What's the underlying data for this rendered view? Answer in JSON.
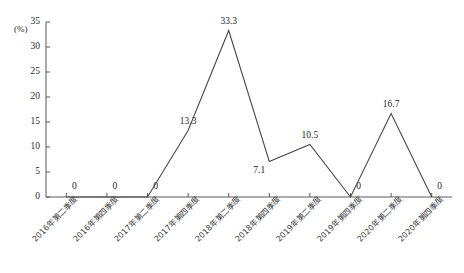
{
  "chart_data": {
    "type": "line",
    "title": "",
    "xlabel": "",
    "ylabel": "(%)",
    "ylim": [
      0,
      35
    ],
    "ytick_values": [
      0,
      5,
      10,
      15,
      20,
      25,
      30,
      35
    ],
    "ytick_labels": [
      "0",
      "5",
      "10",
      "15",
      "20",
      "25",
      "30",
      "35"
    ],
    "grid": false,
    "legend": "none",
    "line_color": "#4a4a4a",
    "categories": [
      "2016年第二季度",
      "2016年第四季度",
      "2017年第二季度",
      "2017年第四季度",
      "2018年第二季度",
      "2018年第四季度",
      "2019年第二季度",
      "2019年第四季度",
      "2020年第二季度",
      "2020年第四季度"
    ],
    "values": [
      0,
      0,
      0,
      13.3,
      33.3,
      7.1,
      10.5,
      0,
      16.7,
      0
    ],
    "point_labels": [
      "0",
      "0",
      "0",
      "13.3",
      "33.3",
      "7.1",
      "10.5",
      "0",
      "16.7",
      "0"
    ],
    "label_positions": [
      "above",
      "above",
      "above",
      "above",
      "above",
      "below",
      "above",
      "above",
      "above",
      "above"
    ]
  }
}
